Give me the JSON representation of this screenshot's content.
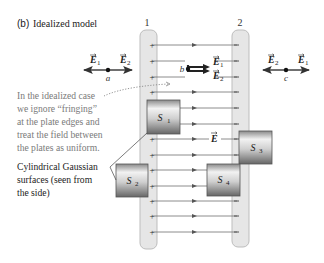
{
  "figure": {
    "panel_label": "(b)",
    "title": "Idealized model",
    "plate_labels": [
      "1",
      "2"
    ],
    "plate1_sign": "+",
    "plate2_sign": "–",
    "field_label": "E",
    "points": {
      "a": {
        "label": "a",
        "vectors": [
          "E1",
          "E2"
        ]
      },
      "b": {
        "label": "b",
        "vectors": [
          "E1",
          "E2"
        ]
      },
      "c": {
        "label": "c",
        "vectors": [
          "E2",
          "E1"
        ]
      }
    },
    "vector_labels": {
      "E1": "E",
      "E1_sub": "1",
      "E2": "E",
      "E2_sub": "2"
    },
    "surfaces": [
      {
        "label": "S",
        "sub": "1"
      },
      {
        "label": "S",
        "sub": "2"
      },
      {
        "label": "S",
        "sub": "3"
      },
      {
        "label": "S",
        "sub": "4"
      }
    ],
    "annotation_idealized": [
      "In the idealized case",
      "we ignore “fringing”",
      "at the plate edges and",
      "treat the field between",
      "the plates as uniform."
    ],
    "annotation_gaussian": [
      "Cylindrical Gaussian",
      "surfaces (seen from",
      "the side)"
    ],
    "colors": {
      "plate_fill": "#e6e6e6",
      "plate_stroke": "#b9b9b9",
      "field_line": "#6e6e6e",
      "annotation_text": "#777777",
      "label_text": "#222222",
      "surface_light": "#f0f0f0",
      "surface_dark": "#6f6f6f"
    }
  }
}
